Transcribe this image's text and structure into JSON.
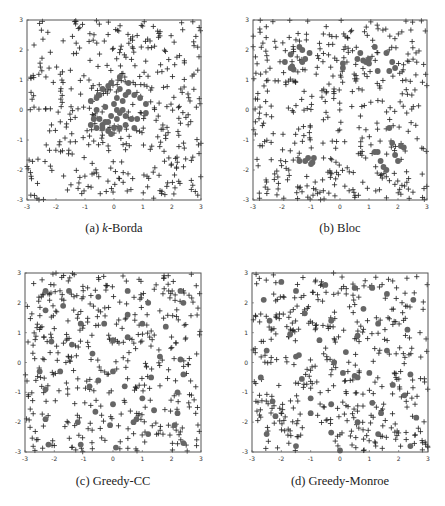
{
  "chart_data": [
    {
      "type": "scatter",
      "id": "a",
      "title": "(a) k-Borda",
      "caption_prefix": "(a) ",
      "caption_italic": "k",
      "caption_suffix": "-Borda",
      "xlim": [
        -3,
        3
      ],
      "ylim": [
        -3,
        3
      ],
      "xticks": [
        -3,
        -2,
        -1,
        0,
        1,
        2,
        3
      ],
      "yticks": [
        -3,
        -2,
        -1,
        0,
        1,
        2,
        3
      ],
      "grid": false,
      "series": [
        {
          "name": "voters/candidates",
          "marker": "+",
          "count": 400,
          "distribution": "uniform[-3,3]^2",
          "seed": 11
        },
        {
          "name": "committee",
          "marker": "dot",
          "points": [
            [
              -0.8,
              0.3
            ],
            [
              -0.6,
              0.4
            ],
            [
              -0.5,
              0.5
            ],
            [
              -0.4,
              0.7
            ],
            [
              -0.2,
              0.8
            ],
            [
              -0.1,
              0.9
            ],
            [
              0.2,
              1.1
            ],
            [
              0.5,
              0.9
            ],
            [
              -0.6,
              0.0
            ],
            [
              -0.3,
              0.1
            ],
            [
              0.0,
              0.2
            ],
            [
              0.1,
              0.4
            ],
            [
              0.3,
              0.3
            ],
            [
              0.4,
              0.5
            ],
            [
              0.5,
              0.6
            ],
            [
              0.7,
              0.5
            ],
            [
              0.9,
              0.4
            ],
            [
              1.1,
              0.2
            ],
            [
              -0.7,
              -0.3
            ],
            [
              -0.5,
              -0.3
            ],
            [
              -0.4,
              -0.5
            ],
            [
              -0.2,
              -0.4
            ],
            [
              -0.1,
              -0.2
            ],
            [
              0.1,
              -0.3
            ],
            [
              0.2,
              -0.1
            ],
            [
              0.3,
              0.0
            ],
            [
              0.4,
              -0.2
            ],
            [
              0.6,
              -0.3
            ],
            [
              0.8,
              -0.3
            ],
            [
              1.1,
              -0.1
            ],
            [
              -0.8,
              -0.5
            ],
            [
              -0.6,
              -0.6
            ],
            [
              -0.4,
              -0.6
            ],
            [
              -0.2,
              -0.7
            ],
            [
              0.0,
              -0.6
            ],
            [
              0.2,
              -0.6
            ],
            [
              0.4,
              -0.5
            ],
            [
              -0.1,
              -0.8
            ],
            [
              0.2,
              0.7
            ],
            [
              0.1,
              -0.0
            ],
            [
              -0.3,
              -0.4
            ],
            [
              0.7,
              -0.6
            ]
          ]
        }
      ]
    },
    {
      "type": "scatter",
      "id": "b",
      "title": "(b) Bloc",
      "caption_prefix": "(b) ",
      "caption_italic": "",
      "caption_suffix": "Bloc",
      "xlim": [
        -3,
        3
      ],
      "ylim": [
        -3,
        3
      ],
      "xticks": [
        -3,
        -2,
        -1,
        0,
        1,
        2,
        3
      ],
      "yticks": [
        -3,
        -2,
        -1,
        0,
        1,
        2,
        3
      ],
      "grid": false,
      "series": [
        {
          "name": "voters/candidates",
          "marker": "+",
          "count": 400,
          "distribution": "uniform[-3,3]^2",
          "seed": 23
        },
        {
          "name": "committee",
          "marker": "dot",
          "points": [
            [
              -1.9,
              1.6
            ],
            [
              -1.7,
              1.4
            ],
            [
              -1.6,
              1.35
            ],
            [
              -1.65,
              1.45
            ],
            [
              -1.3,
              1.6
            ],
            [
              -1.2,
              1.7
            ],
            [
              -1.3,
              2.0
            ],
            [
              -1.4,
              2.1
            ],
            [
              -1.7,
              1.85
            ],
            [
              -1.05,
              1.9
            ],
            [
              0.1,
              1.4
            ],
            [
              0.1,
              1.55
            ],
            [
              0.6,
              1.7
            ],
            [
              0.8,
              1.65
            ],
            [
              0.9,
              1.6
            ],
            [
              1.0,
              1.7
            ],
            [
              1.2,
              2.1
            ],
            [
              1.3,
              1.3
            ],
            [
              1.6,
              1.9
            ],
            [
              1.7,
              1.3
            ],
            [
              1.8,
              1.6
            ],
            [
              1.9,
              1.4
            ],
            [
              0.7,
              1.9
            ],
            [
              1.0,
              1.55
            ],
            [
              -1.4,
              -1.7
            ],
            [
              -1.2,
              -1.7
            ],
            [
              -1.1,
              -1.6
            ],
            [
              -1.0,
              -1.8
            ],
            [
              -0.95,
              -1.75
            ],
            [
              -0.9,
              -1.6
            ],
            [
              1.2,
              -1.4
            ],
            [
              1.3,
              -1.4
            ],
            [
              1.4,
              -1.7
            ],
            [
              1.5,
              -1.9
            ],
            [
              1.7,
              -0.6
            ],
            [
              1.8,
              -1.1
            ],
            [
              1.9,
              -1.5
            ],
            [
              2.0,
              -1.7
            ],
            [
              2.1,
              -1.2
            ],
            [
              2.2,
              -1.25
            ],
            [
              1.6,
              -2.0
            ]
          ]
        }
      ]
    },
    {
      "type": "scatter",
      "id": "c",
      "title": "(c) Greedy-CC",
      "caption_prefix": "(c) ",
      "caption_italic": "",
      "caption_suffix": "Greedy-CC",
      "xlim": [
        -3,
        3
      ],
      "ylim": [
        -3,
        3
      ],
      "xticks": [
        -3,
        -2,
        -1,
        0,
        1,
        2,
        3
      ],
      "yticks": [
        -3,
        -2,
        -1,
        0,
        1,
        2,
        3
      ],
      "grid": false,
      "series": [
        {
          "name": "voters/candidates",
          "marker": "+",
          "count": 400,
          "distribution": "uniform[-3,3]^2",
          "seed": 37
        },
        {
          "name": "committee",
          "marker": "dot",
          "points": [
            [
              -2.3,
              2.4
            ],
            [
              -1.5,
              2.4
            ],
            [
              -0.5,
              2.2
            ],
            [
              0.5,
              2.4
            ],
            [
              1.2,
              2.0
            ],
            [
              2.3,
              2.4
            ],
            [
              -2.3,
              1.75
            ],
            [
              -1.7,
              1.9
            ],
            [
              -1.1,
              1.3
            ],
            [
              -0.3,
              1.3
            ],
            [
              0.5,
              1.6
            ],
            [
              1.0,
              1.3
            ],
            [
              1.8,
              1.2
            ],
            [
              2.4,
              2.0
            ],
            [
              -2.1,
              0.7
            ],
            [
              -1.4,
              0.6
            ],
            [
              -0.7,
              0.3
            ],
            [
              0.0,
              0.75
            ],
            [
              0.5,
              0.85
            ],
            [
              1.6,
              0.2
            ],
            [
              2.3,
              0.1
            ],
            [
              -2.5,
              -0.3
            ],
            [
              -1.8,
              -0.3
            ],
            [
              -0.5,
              -0.6
            ],
            [
              0.0,
              -0.3
            ],
            [
              0.4,
              -0.8
            ],
            [
              1.3,
              -0.5
            ],
            [
              2.4,
              -0.4
            ],
            [
              -2.3,
              -0.9
            ],
            [
              -0.8,
              -0.8
            ],
            [
              0.0,
              -1.4
            ],
            [
              1.0,
              -1.2
            ],
            [
              2.2,
              -1.0
            ],
            [
              -2.3,
              -1.9
            ],
            [
              -1.2,
              -2.0
            ],
            [
              -0.1,
              -2.1
            ],
            [
              0.8,
              -1.9
            ],
            [
              1.4,
              -1.6
            ],
            [
              2.1,
              -2.1
            ],
            [
              -2.2,
              -2.75
            ],
            [
              -1.1,
              -2.75
            ],
            [
              0.1,
              -2.85
            ],
            [
              1.2,
              -2.4
            ],
            [
              2.4,
              -2.7
            ],
            [
              2.2,
              -1.7
            ],
            [
              -0.6,
              -1.65
            ],
            [
              0.7,
              -2.0
            ]
          ]
        }
      ]
    },
    {
      "type": "scatter",
      "id": "d",
      "title": "(d) Greedy-Monroe",
      "caption_prefix": "(d) ",
      "caption_italic": "",
      "caption_suffix": "Greedy-Monroe",
      "xlim": [
        -3,
        3
      ],
      "ylim": [
        -3,
        3
      ],
      "xticks": [
        -3,
        -2,
        -1,
        0,
        1,
        2,
        3
      ],
      "yticks": [
        -3,
        -2,
        -1,
        0,
        1,
        2,
        3
      ],
      "grid": false,
      "series": [
        {
          "name": "voters/candidates",
          "marker": "+",
          "count": 400,
          "distribution": "uniform[-3,3]^2",
          "seed": 53
        },
        {
          "name": "committee",
          "marker": "dot",
          "points": [
            [
              -2.0,
              2.7
            ],
            [
              -1.5,
              2.4
            ],
            [
              -0.5,
              2.6
            ],
            [
              0.5,
              2.5
            ],
            [
              1.1,
              2.5
            ],
            [
              1.6,
              2.3
            ],
            [
              2.5,
              2.1
            ],
            [
              -2.6,
              2.1
            ],
            [
              -1.2,
              1.65
            ],
            [
              -0.3,
              1.4
            ],
            [
              0.8,
              1.8
            ],
            [
              1.3,
              1.3
            ],
            [
              2.3,
              1.1
            ],
            [
              -2.4,
              1.4
            ],
            [
              -1.7,
              0.95
            ],
            [
              -0.7,
              0.75
            ],
            [
              0.2,
              0.35
            ],
            [
              0.6,
              0.9
            ],
            [
              1.6,
              0.4
            ],
            [
              -2.5,
              0.4
            ],
            [
              -1.5,
              0.2
            ],
            [
              -1.4,
              0.25
            ],
            [
              -0.2,
              -0.0
            ],
            [
              0.5,
              -0.45
            ],
            [
              1.0,
              -0.35
            ],
            [
              1.8,
              -0.75
            ],
            [
              2.4,
              -0.4
            ],
            [
              -2.7,
              -0.5
            ],
            [
              -1.3,
              -0.55
            ],
            [
              0.1,
              -0.35
            ],
            [
              0.6,
              -0.5
            ],
            [
              2.2,
              -1.1
            ],
            [
              -2.3,
              -1.3
            ],
            [
              -1.0,
              -1.2
            ],
            [
              -0.3,
              -1.4
            ],
            [
              1.1,
              -1.35
            ],
            [
              1.4,
              -1.7
            ],
            [
              2.6,
              -1.85
            ],
            [
              -2.2,
              -1.8
            ],
            [
              -1.0,
              -1.7
            ],
            [
              0.6,
              -2.0
            ],
            [
              -2.5,
              -2.4
            ],
            [
              -1.5,
              -2.8
            ],
            [
              -0.3,
              -2.35
            ],
            [
              1.3,
              -2.4
            ],
            [
              2.4,
              -2.8
            ],
            [
              0.0,
              -2.95
            ]
          ]
        }
      ]
    }
  ],
  "colors": {
    "plus": "#222222",
    "dot": "#666666",
    "axis": "#555555"
  }
}
